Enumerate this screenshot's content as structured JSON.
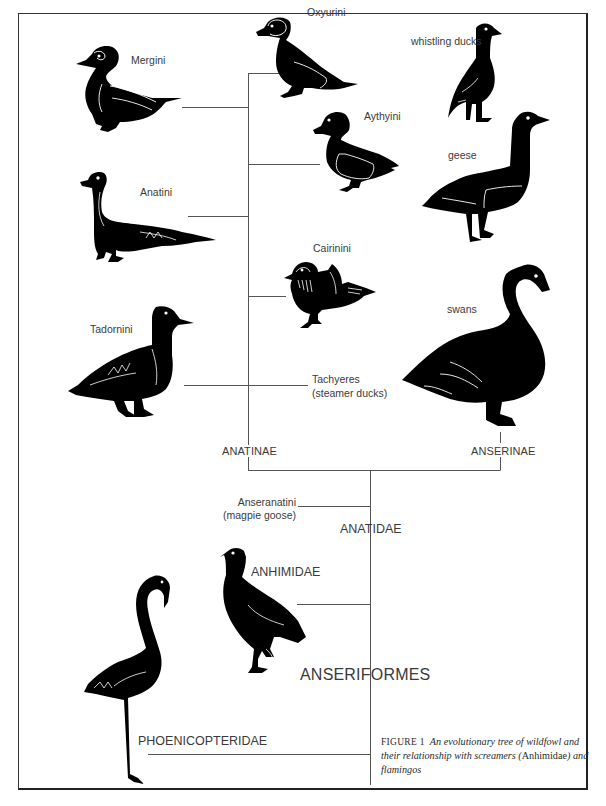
{
  "figure": {
    "caption": {
      "figure_label": "FIGURE 1",
      "text_part1": "An evolutionary tree of wildfowl and their relationship with screamers (",
      "taxon": "Anhimidae",
      "text_part2": ") and flamingos"
    },
    "colors": {
      "ink": "#000000",
      "line": "#555555",
      "text": "#3a3a3a",
      "background": "#ffffff"
    }
  },
  "tree": {
    "order": "ANSERIFORMES",
    "families": [
      {
        "name": "ANATIDAE"
      },
      {
        "name": "ANHIMIDAE"
      },
      {
        "name": "PHOENICOPTERIDAE"
      }
    ],
    "subfamilies": [
      {
        "name": "ANATINAE"
      },
      {
        "name": "ANSERINAE"
      }
    ],
    "anatinae_tribes": [
      {
        "name": "Mergini"
      },
      {
        "name": "Oxyurini"
      },
      {
        "name": "Aythyini"
      },
      {
        "name": "Anatini"
      },
      {
        "name": "Cairinini"
      },
      {
        "name": "Tadornini"
      },
      {
        "name": "Tachyeres",
        "note": "(steamer ducks)"
      }
    ],
    "anserinae_groups": [
      {
        "name": "whistling ducks"
      },
      {
        "name": "geese"
      },
      {
        "name": "swans"
      }
    ],
    "basal_anatidae": {
      "name": "Anseranatini",
      "note": "(magpie goose)"
    }
  }
}
